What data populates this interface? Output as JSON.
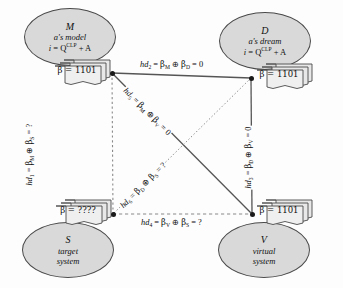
{
  "diagram": {
    "colors": {
      "node_fill": "#d9d9d9",
      "node_stroke": "#4a4a4a",
      "doc_fill": "#e8e8e8",
      "doc_stroke": "#4a4a4a",
      "edge_solid": "#555555",
      "edge_dashed": "#777777",
      "vertex": "#1a1a1a",
      "background": "#fdfdfd"
    },
    "nodes": [
      {
        "id": "M",
        "letter": "M",
        "subtitle": "a's model",
        "equation_lhs": "i",
        "equation_rhs": "Q",
        "equation_sup": "CLP",
        "equation_tail": "+ A",
        "beta_label": "β = 1101",
        "position": "top-left"
      },
      {
        "id": "D",
        "letter": "D",
        "subtitle": "a's dream",
        "equation_lhs": "i",
        "equation_rhs": "Q",
        "equation_sup": "CLP",
        "equation_tail": "+ A",
        "beta_label": "β = 1101",
        "position": "top-right"
      },
      {
        "id": "S",
        "letter": "S",
        "subtitle_line1": "target",
        "subtitle_line2": "system",
        "beta_label": "β = ????",
        "position": "bottom-left"
      },
      {
        "id": "V",
        "letter": "V",
        "subtitle_line1": "virtual",
        "subtitle_line2": "system",
        "beta_label": "β = 1101",
        "position": "bottom-right"
      }
    ],
    "edges": [
      {
        "id": "hd1",
        "name": "hd",
        "index": "1",
        "from": "M",
        "to": "S",
        "style": "dashed",
        "operand_a": "β",
        "sub_a": "M",
        "operator": "⊕",
        "operand_b": "β",
        "sub_b": "S",
        "result": "?",
        "full": "hd1 = βM ⊕ βS = ?"
      },
      {
        "id": "hd2",
        "name": "hd",
        "index": "2",
        "from": "M",
        "to": "D",
        "style": "solid",
        "operand_a": "β",
        "sub_a": "M",
        "operator": "⊕",
        "operand_b": "β",
        "sub_b": "D",
        "result": "0",
        "full": "hd2 = βM ⊕ βD = 0"
      },
      {
        "id": "hd3",
        "name": "hd",
        "index": "3",
        "from": "D",
        "to": "V",
        "style": "solid",
        "operand_a": "β",
        "sub_a": "D",
        "operator": "⊕",
        "operand_b": "β",
        "sub_b": "V",
        "result": "0",
        "full": "hd3 = βD ⊕ βV = 0"
      },
      {
        "id": "hd4",
        "name": "hd",
        "index": "4",
        "from": "V",
        "to": "S",
        "style": "dashed",
        "operand_a": "β",
        "sub_a": "V",
        "operator": "⊕",
        "operand_b": "β",
        "sub_b": "S",
        "result": "?",
        "full": "hd4 = βV ⊕ βS = ?"
      },
      {
        "id": "hd5",
        "name": "hd",
        "index": "5",
        "from": "M",
        "to": "V",
        "style": "solid",
        "operand_a": "β",
        "sub_a": "M",
        "operator": "⊕",
        "operand_b": "β",
        "sub_b": "V",
        "result": "0",
        "full": "hd5 = βM ⊕ βV = 0"
      },
      {
        "id": "hd6",
        "name": "hd",
        "index": "6",
        "from": "D",
        "to": "S",
        "style": "dotted",
        "operand_a": "β",
        "sub_a": "D",
        "operator": "⊕",
        "operand_b": "β",
        "sub_b": "S",
        "result": "?",
        "full": "hd6 = βD ⊕ βS = ?"
      }
    ]
  }
}
